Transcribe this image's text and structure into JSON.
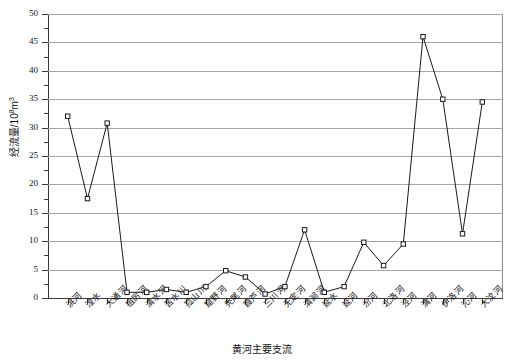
{
  "chart_data": {
    "type": "line",
    "title": "",
    "xlabel": "黄河主要支流",
    "ylabel": "经流量/10⁸m³",
    "ylim": [
      0,
      50
    ],
    "ytick_step": 5,
    "yminor_step": 2.5,
    "grid": true,
    "legend": "none",
    "marker": "open-square",
    "line_color": "#1a1a1a",
    "grid_color": "#a6a6a6",
    "categories": [
      "洮河",
      "湟水",
      "大通河",
      "祖厉河",
      "清水河",
      "苦水川",
      "孤山川",
      "窟野河",
      "秃尾河",
      "葭芦河",
      "三川河",
      "无定河",
      "清涧河",
      "延水",
      "延河",
      "汾河",
      "北洛河",
      "泾河",
      "渭河",
      "伊洛河",
      "沁河",
      "大汶河"
    ],
    "values": [
      32.0,
      17.5,
      30.8,
      1.0,
      1.0,
      1.5,
      1.0,
      2.0,
      4.8,
      3.7,
      0.7,
      2.0,
      12.0,
      1.0,
      2.0,
      9.8,
      5.7,
      9.5,
      46.0,
      35.0,
      11.3,
      34.5
    ],
    "ytick_labels": [
      "0",
      "5",
      "10",
      "15",
      "20",
      "25",
      "30",
      "35",
      "40",
      "45",
      "50"
    ]
  }
}
